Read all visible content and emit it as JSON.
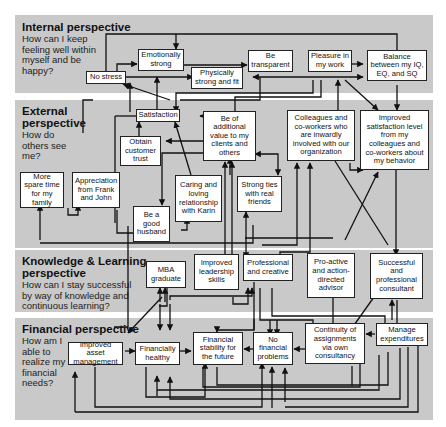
{
  "perspectives": [
    {
      "id": "internal",
      "title": "Internal perspective",
      "question": "How can I keep feeling well within myself and be happy?"
    },
    {
      "id": "external",
      "title": "External perspective",
      "question": "How do others see me?"
    },
    {
      "id": "knowledge",
      "title": "Knowledge & Learning perspective",
      "question": "How can I stay successful by way of knowledge and continuous learning?"
    },
    {
      "id": "financial",
      "title": "Financial perspective",
      "question": "How am I able to realize my financial needs?"
    }
  ],
  "nodes": {
    "no_stress": "No stress",
    "emotionally_strong": "Emotionally strong",
    "physically_strong": "Physically strong and fit",
    "be_transparent": "Be transparent",
    "pleasure_in_work": "Pleasure in my work",
    "balance": "Balance between my IQ, EQ, and SQ",
    "satisfaction": "Satisfaction",
    "obtain_trust": "Obtain customer trust",
    "additional_value": "Be of additional value to my clients and others",
    "colleagues_involved": "Colleagues and co-workers who are inwardly involved with our organization",
    "improved_satisfaction": "Improved satisfaction level from my colleagues and co-workers about my behavior",
    "more_spare_time": "More spare time for my family",
    "appreciation": "Appreciation from Frank and John",
    "caring_relationship": "Caring and loving relationship with Karin",
    "good_husband": "Be a good husband",
    "strong_ties": "Strong ties with real friends",
    "mba_graduate": "MBA graduate",
    "leadership_skills": "Improved leadership skills",
    "professional_creative": "Professional and creative",
    "proactive_advisor": "Pro-active and action-directed advisor",
    "successful_consultant": "Successful and professional consultant",
    "asset_management": "Improved asset management",
    "financially_healthy": "Financially healthy",
    "financial_stability": "Financial stability for the future",
    "no_financial_problems": "No financial problems",
    "continuity_assignments": "Continuity of assignments via own consultancy",
    "manage_expenditures": "Manage expenditures"
  },
  "colors": {
    "band": "#c9c9c9",
    "node_bg": "#ffffff",
    "line": "#111111"
  }
}
